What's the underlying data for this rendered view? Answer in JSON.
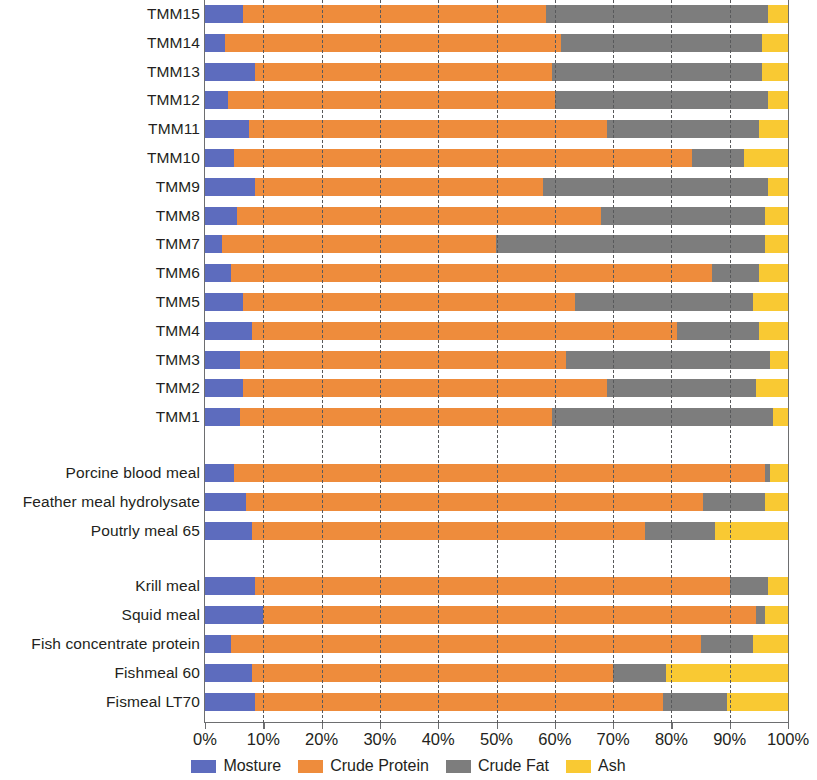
{
  "chart_data": {
    "type": "bar",
    "orientation": "horizontal",
    "stacked": true,
    "normalized": true,
    "title": "",
    "subtitle": "",
    "xlabel": "",
    "ylabel": "",
    "xlim": [
      0,
      100
    ],
    "x_unit": "%",
    "grid": true,
    "grid_axis": "x",
    "grid_style": "dashed",
    "legend_position": "bottom",
    "xticks": [
      0,
      10,
      20,
      30,
      40,
      50,
      60,
      70,
      80,
      90,
      100
    ],
    "xtick_labels": [
      "0%",
      "10%",
      "20%",
      "30%",
      "40%",
      "50%",
      "60%",
      "70%",
      "80%",
      "90%",
      "100%"
    ],
    "series": [
      {
        "name": "Mosture",
        "color": "#5d6cbe"
      },
      {
        "name": "Crude Protein",
        "color": "#ee8c3c"
      },
      {
        "name": "Crude Fat",
        "color": "#7d7d7d"
      },
      {
        "name": "Ash",
        "color": "#f9c933"
      }
    ],
    "groups": [
      {
        "name": "tmm-group",
        "categories": [
          {
            "label": "TMM15",
            "values": [
              6.5,
              52.0,
              38.0,
              3.5
            ]
          },
          {
            "label": "TMM14",
            "values": [
              3.5,
              57.5,
              34.5,
              4.5
            ]
          },
          {
            "label": "TMM13",
            "values": [
              8.5,
              51.0,
              36.0,
              4.5
            ]
          },
          {
            "label": "TMM12",
            "values": [
              4.0,
              56.0,
              36.5,
              3.5
            ]
          },
          {
            "label": "TMM11",
            "values": [
              7.5,
              61.5,
              26.0,
              5.0
            ]
          },
          {
            "label": "TMM10",
            "values": [
              5.0,
              78.5,
              9.0,
              7.5
            ]
          },
          {
            "label": "TMM9",
            "values": [
              8.5,
              49.5,
              38.5,
              3.5
            ]
          },
          {
            "label": "TMM8",
            "values": [
              5.5,
              62.5,
              28.0,
              4.0
            ]
          },
          {
            "label": "TMM7",
            "values": [
              3.0,
              47.0,
              46.0,
              4.0
            ]
          },
          {
            "label": "TMM6",
            "values": [
              4.5,
              82.5,
              8.0,
              5.0
            ]
          },
          {
            "label": "TMM5",
            "values": [
              6.5,
              57.0,
              30.5,
              6.0
            ]
          },
          {
            "label": "TMM4",
            "values": [
              8.0,
              73.0,
              14.0,
              5.0
            ]
          },
          {
            "label": "TMM3",
            "values": [
              6.0,
              56.0,
              35.0,
              3.0
            ]
          },
          {
            "label": "TMM2",
            "values": [
              6.5,
              62.5,
              25.5,
              5.5
            ]
          },
          {
            "label": "TMM1",
            "values": [
              6.0,
              53.5,
              38.0,
              2.5
            ]
          }
        ]
      },
      {
        "name": "terrestrial-meals-group",
        "categories": [
          {
            "label": "Porcine blood meal",
            "values": [
              5.0,
              91.0,
              1.0,
              3.0
            ]
          },
          {
            "label": "Feather meal hydrolysate",
            "values": [
              7.0,
              78.5,
              10.5,
              4.0
            ]
          },
          {
            "label": "Poutrly meal 65",
            "values": [
              8.0,
              67.5,
              12.0,
              12.5
            ]
          }
        ]
      },
      {
        "name": "marine-meals-group",
        "categories": [
          {
            "label": "Krill meal",
            "values": [
              8.5,
              81.5,
              6.5,
              3.5
            ]
          },
          {
            "label": "Squid meal",
            "values": [
              10.0,
              84.5,
              1.5,
              4.0
            ]
          },
          {
            "label": "Fish concentrate protein",
            "values": [
              4.5,
              80.5,
              9.0,
              6.0
            ]
          },
          {
            "label": "Fishmeal 60",
            "values": [
              8.0,
              62.0,
              9.0,
              21.0
            ]
          },
          {
            "label": "Fismeal LT70",
            "values": [
              8.5,
              70.0,
              11.0,
              10.5
            ]
          }
        ]
      }
    ]
  },
  "legend": {
    "items": [
      {
        "label": "Mosture",
        "color": "#5d6cbe"
      },
      {
        "label": "Crude Protein",
        "color": "#ee8c3c"
      },
      {
        "label": "Crude Fat",
        "color": "#7d7d7d"
      },
      {
        "label": "Ash",
        "color": "#f9c933"
      }
    ]
  },
  "colors": {
    "moisture": "#5d6cbe",
    "crude_protein": "#ee8c3c",
    "crude_fat": "#7d7d7d",
    "ash": "#f9c933",
    "axis": "#6d6e70",
    "text": "#231f20",
    "background": "#ffffff"
  }
}
